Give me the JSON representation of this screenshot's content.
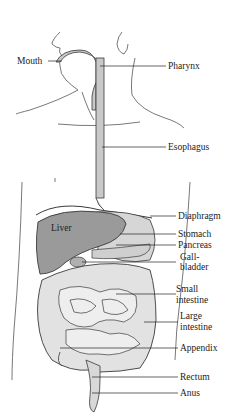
{
  "diagram": {
    "type": "anatomical",
    "labels": {
      "mouth": "Mouth",
      "pharynx": "Pharynx",
      "esophagus": "Esophagus",
      "liver": "Liver",
      "diaphragm": "Diaphragm",
      "stomach": "Stomach",
      "pancreas": "Pancreas",
      "gallbladder_1": "Gall-",
      "gallbladder_2": "bladder",
      "small_intestine_1": "Small",
      "small_intestine_2": "intestine",
      "large_intestine_1": "Large",
      "large_intestine_2": "intestine",
      "appendix": "Appendix",
      "rectum": "Rectum",
      "anus": "Anus"
    },
    "colors": {
      "outline": "#3a3a3a",
      "organ_fill": "#c9c9c9",
      "liver_fill": "#9a9a9a",
      "intestine_fill": "#e2e2e2",
      "background": "#ffffff"
    }
  }
}
